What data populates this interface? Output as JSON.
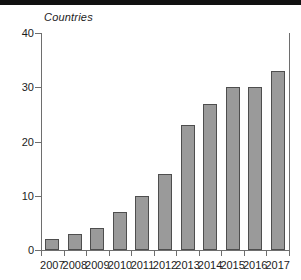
{
  "chart_data": {
    "type": "bar",
    "title": "",
    "subtitle": "",
    "xlabel": "",
    "ylabel": "Countries",
    "categories": [
      "2007",
      "2008",
      "2009",
      "2010",
      "2011",
      "2012",
      "2013",
      "2014",
      "2015",
      "2016",
      "2017"
    ],
    "values": [
      2,
      3,
      4,
      7,
      10,
      14,
      23,
      27,
      30,
      30,
      33
    ],
    "ylim": [
      0,
      40
    ],
    "y_ticks": [
      0,
      10,
      20,
      30,
      40
    ],
    "y_tick_labels": [
      "0",
      "10",
      "20",
      "30",
      "40"
    ],
    "grid": false,
    "legend": null,
    "legend_position": "none",
    "annotations": [],
    "colors": {
      "bar_fill": "#9a9a9a",
      "bar_stroke": "#4e4e4e",
      "axis": "#6e6e6e",
      "text": "#1c1c1c",
      "background": "#ffffff"
    }
  }
}
